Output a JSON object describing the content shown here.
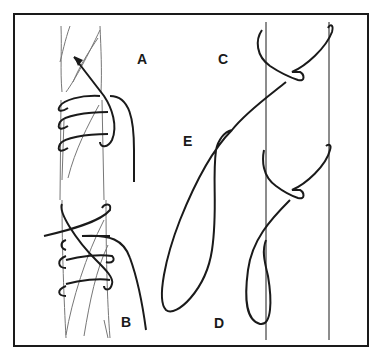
{
  "figure": {
    "type": "knot-illustration",
    "labels": [
      {
        "id": "A",
        "text": "A",
        "x": 137,
        "y": 59
      },
      {
        "id": "B",
        "text": "B",
        "x": 121,
        "y": 322
      },
      {
        "id": "C",
        "text": "C",
        "x": 218,
        "y": 55
      },
      {
        "id": "D",
        "text": "D",
        "x": 214,
        "y": 322
      },
      {
        "id": "E",
        "text": "E",
        "x": 183,
        "y": 134
      }
    ],
    "colors": {
      "ink": "#1a1a1a",
      "rope_strand": "#777777",
      "background": "#ffffff"
    }
  }
}
